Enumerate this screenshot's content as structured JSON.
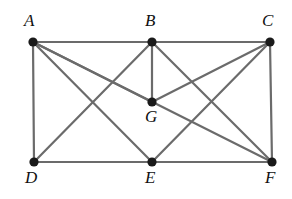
{
  "figure": {
    "type": "graph-diagram",
    "title": "",
    "width": 292,
    "height": 199,
    "background_color": "#ffffff",
    "edge_color": "#6b6b6b",
    "vertex_color": "#1a1a1a",
    "label_color": "#111111"
  },
  "graph": {
    "vertices": [
      {
        "id": "A",
        "label": "A",
        "x": 33,
        "y": 42,
        "label_x": 24,
        "label_y": 12
      },
      {
        "id": "B",
        "label": "B",
        "x": 152,
        "y": 42,
        "label_x": 145,
        "label_y": 12
      },
      {
        "id": "C",
        "label": "C",
        "x": 270,
        "y": 42,
        "label_x": 262,
        "label_y": 12
      },
      {
        "id": "G",
        "label": "G",
        "x": 152,
        "y": 102,
        "label_x": 145,
        "label_y": 108
      },
      {
        "id": "D",
        "label": "D",
        "x": 34,
        "y": 162,
        "label_x": 25,
        "label_y": 169
      },
      {
        "id": "E",
        "label": "E",
        "x": 152,
        "y": 162,
        "label_x": 145,
        "label_y": 169
      },
      {
        "id": "F",
        "label": "F",
        "x": 272,
        "y": 162,
        "label_x": 265,
        "label_y": 169
      }
    ],
    "edges": [
      {
        "from": "A",
        "to": "B"
      },
      {
        "from": "B",
        "to": "C"
      },
      {
        "from": "A",
        "to": "D"
      },
      {
        "from": "C",
        "to": "F"
      },
      {
        "from": "D",
        "to": "E"
      },
      {
        "from": "E",
        "to": "F"
      },
      {
        "from": "A",
        "to": "G"
      },
      {
        "from": "B",
        "to": "G"
      },
      {
        "from": "C",
        "to": "G"
      },
      {
        "from": "A",
        "to": "E"
      },
      {
        "from": "A",
        "to": "F"
      },
      {
        "from": "B",
        "to": "D"
      },
      {
        "from": "B",
        "to": "F"
      },
      {
        "from": "C",
        "to": "E"
      }
    ],
    "vertex_radius": 4.6
  }
}
